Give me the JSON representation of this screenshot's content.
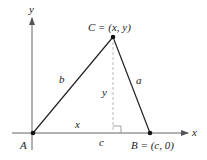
{
  "diagram": {
    "axes": {
      "x_label": "x",
      "y_label": "y"
    },
    "vertices": {
      "A": {
        "name": "A",
        "label": "A"
      },
      "B": {
        "name": "B",
        "label": "B = (c, 0)"
      },
      "C": {
        "name": "C",
        "label": "C = (x, y)"
      }
    },
    "sides": {
      "a": "a",
      "b": "b",
      "c": "c"
    },
    "segments": {
      "foot_x": "x",
      "height_y": "y"
    },
    "colors": {
      "stroke": "#222222",
      "axis": "#555555",
      "dashed": "#999999"
    }
  }
}
